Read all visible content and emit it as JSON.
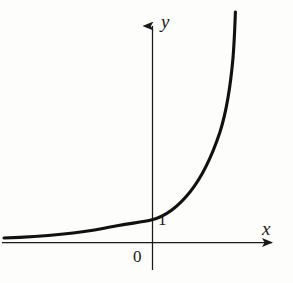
{
  "figure": {
    "title": "",
    "background_color": "#fdfdfb",
    "ink_color": "#1a1a1a"
  },
  "labels": {
    "x_axis": "x",
    "y_axis": "y",
    "origin": "0",
    "y_intercept": "1"
  },
  "chart_data": {
    "type": "line",
    "title": "",
    "xlabel": "x",
    "ylabel": "y",
    "grid": false,
    "legend": null,
    "annotations": [
      {
        "text": "0",
        "x": 0,
        "y": 0,
        "note": "origin label, placed below-left of origin"
      },
      {
        "text": "1",
        "x": 0,
        "y": 1,
        "note": "y-intercept label, placed right of axis"
      }
    ],
    "axis_style": {
      "arrowheads": true,
      "x_axis_y_value": 0,
      "y_axis_x_value": 0
    },
    "xlim": [
      -3.7,
      3.4
    ],
    "ylim": [
      -0.72,
      6.0
    ],
    "series": [
      {
        "name": "y = a^x  (a > 1)",
        "equation": "y = a^x",
        "curve_color": "#111111",
        "line_width": 3,
        "asymptote": "y = 0 as x decreases",
        "x": [
          -3.7,
          -3.3,
          -2.9,
          -2.5,
          -2.1,
          -1.7,
          -1.3,
          -1.0,
          -0.7,
          -0.4,
          -0.2,
          0.0,
          0.2,
          0.4,
          0.6,
          0.8,
          1.0,
          1.2,
          1.4,
          1.6,
          1.8,
          2.0,
          2.2,
          2.4,
          2.55
        ],
        "values": [
          0.06,
          0.08,
          0.1,
          0.13,
          0.17,
          0.23,
          0.31,
          0.39,
          0.5,
          0.64,
          0.76,
          1.0,
          1.18,
          1.39,
          1.64,
          1.94,
          2.29,
          2.7,
          3.19,
          3.77,
          4.45,
          5.25,
          6.2,
          7.32,
          8.05
        ]
      }
    ]
  },
  "curve_path": {
    "d": "M 4 238 C 40 236.6 78 233.5 104 228.2 C 126 223.6 142 222.4 152 219.8 C 166 216.2 178 207 190 192 C 202 177 212 156 220 132 C 226 113 230.5 86 233 58 C 234.4 41 234.9 25 235.4 12",
    "note": "pixel path of the exponential curve in the 293x283 image"
  }
}
